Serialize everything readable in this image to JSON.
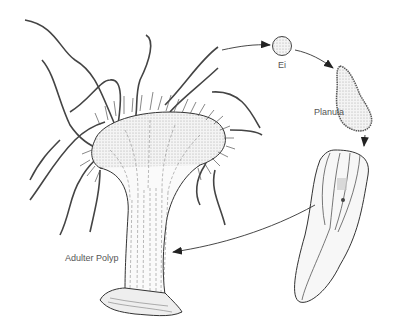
{
  "diagram": {
    "stages": [
      {
        "id": "egg",
        "label": "Ei"
      },
      {
        "id": "planula",
        "label": "Planula"
      },
      {
        "id": "young-polyp",
        "label": ""
      },
      {
        "id": "adult-polyp",
        "label": "Adulter Polyp"
      }
    ],
    "arrows": [
      {
        "from": "adult-polyp",
        "to": "egg"
      },
      {
        "from": "egg",
        "to": "planula"
      },
      {
        "from": "planula",
        "to": "young-polyp"
      },
      {
        "from": "young-polyp",
        "to": "adult-polyp"
      }
    ],
    "colors": {
      "ink": "#333333",
      "shade": "#cfcfcf",
      "label": "#555555"
    }
  }
}
